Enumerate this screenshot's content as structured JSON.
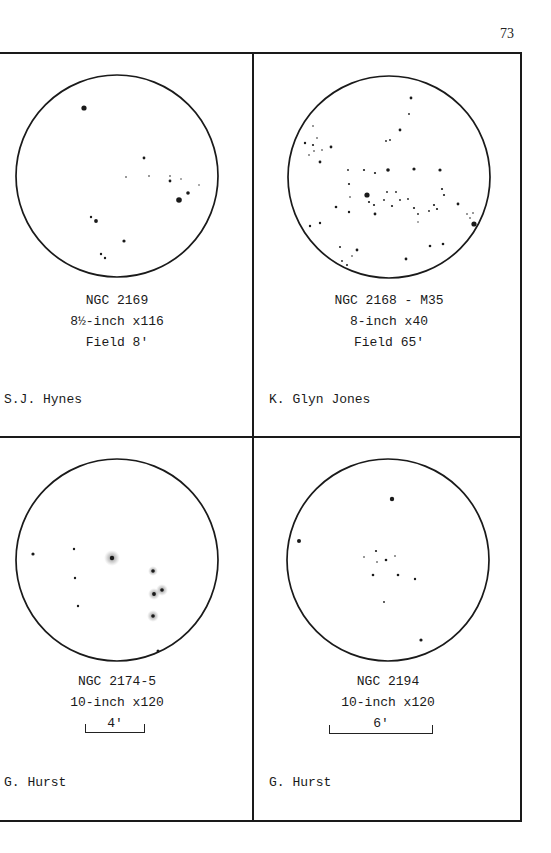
{
  "page": {
    "number": "73"
  },
  "panels": [
    {
      "object": "NGC 2169",
      "telescope": "8½-inch x116",
      "field": "Field 8'",
      "observer": "S.J. Hynes",
      "circle": {
        "cx": 117,
        "cy": 176,
        "r": 101
      },
      "stars": [
        {
          "x": 84,
          "y": 108,
          "s": 2.6
        },
        {
          "x": 144,
          "y": 158,
          "s": 1.4
        },
        {
          "x": 126,
          "y": 177,
          "s": 0.8
        },
        {
          "x": 149,
          "y": 176,
          "s": 0.8
        },
        {
          "x": 170,
          "y": 176,
          "s": 0.8
        },
        {
          "x": 170,
          "y": 181,
          "s": 1.4
        },
        {
          "x": 181,
          "y": 179,
          "s": 0.7
        },
        {
          "x": 199,
          "y": 185,
          "s": 0.7
        },
        {
          "x": 188,
          "y": 193,
          "s": 1.8
        },
        {
          "x": 179,
          "y": 200,
          "s": 2.8
        },
        {
          "x": 91,
          "y": 217,
          "s": 1.2
        },
        {
          "x": 96,
          "y": 221,
          "s": 1.9
        },
        {
          "x": 124,
          "y": 241,
          "s": 1.6
        },
        {
          "x": 101,
          "y": 254,
          "s": 1.2
        },
        {
          "x": 105,
          "y": 258,
          "s": 1.2
        }
      ]
    },
    {
      "object": "NGC 2168 - M35",
      "telescope": "8-inch x40",
      "field": "Field 65'",
      "observer": "K. Glyn Jones",
      "circle": {
        "cx": 389,
        "cy": 177,
        "r": 101
      },
      "stars": [
        {
          "x": 411,
          "y": 98,
          "s": 1.4
        },
        {
          "x": 409,
          "y": 114,
          "s": 0.9
        },
        {
          "x": 400,
          "y": 130,
          "s": 1.4
        },
        {
          "x": 386,
          "y": 141,
          "s": 0.9
        },
        {
          "x": 390,
          "y": 140,
          "s": 0.9
        },
        {
          "x": 313,
          "y": 126,
          "s": 0.8
        },
        {
          "x": 305,
          "y": 143,
          "s": 1.2
        },
        {
          "x": 317,
          "y": 138,
          "s": 0.8
        },
        {
          "x": 313,
          "y": 145,
          "s": 1.1
        },
        {
          "x": 314,
          "y": 151,
          "s": 0.8
        },
        {
          "x": 322,
          "y": 150,
          "s": 0.8
        },
        {
          "x": 331,
          "y": 147,
          "s": 1.4
        },
        {
          "x": 309,
          "y": 155,
          "s": 0.8
        },
        {
          "x": 320,
          "y": 162,
          "s": 1.4
        },
        {
          "x": 348,
          "y": 170,
          "s": 0.9
        },
        {
          "x": 364,
          "y": 170,
          "s": 1.1
        },
        {
          "x": 375,
          "y": 173,
          "s": 1.1
        },
        {
          "x": 388,
          "y": 170,
          "s": 1.8
        },
        {
          "x": 414,
          "y": 169,
          "s": 1.6
        },
        {
          "x": 440,
          "y": 170,
          "s": 1.6
        },
        {
          "x": 349,
          "y": 184,
          "s": 1.1
        },
        {
          "x": 367,
          "y": 195,
          "s": 2.6
        },
        {
          "x": 350,
          "y": 197,
          "s": 0.8
        },
        {
          "x": 369,
          "y": 202,
          "s": 1.1
        },
        {
          "x": 374,
          "y": 205,
          "s": 1.1
        },
        {
          "x": 387,
          "y": 192,
          "s": 0.9
        },
        {
          "x": 396,
          "y": 192,
          "s": 0.9
        },
        {
          "x": 384,
          "y": 200,
          "s": 0.9
        },
        {
          "x": 400,
          "y": 200,
          "s": 0.9
        },
        {
          "x": 408,
          "y": 199,
          "s": 0.9
        },
        {
          "x": 392,
          "y": 206,
          "s": 1.1
        },
        {
          "x": 442,
          "y": 189,
          "s": 1.1
        },
        {
          "x": 444,
          "y": 195,
          "s": 1.1
        },
        {
          "x": 336,
          "y": 207,
          "s": 1.3
        },
        {
          "x": 349,
          "y": 212,
          "s": 1.2
        },
        {
          "x": 375,
          "y": 214,
          "s": 1.4
        },
        {
          "x": 414,
          "y": 208,
          "s": 1.1
        },
        {
          "x": 418,
          "y": 214,
          "s": 0.9
        },
        {
          "x": 418,
          "y": 222,
          "s": 0.7
        },
        {
          "x": 429,
          "y": 211,
          "s": 0.9
        },
        {
          "x": 434,
          "y": 205,
          "s": 1.1
        },
        {
          "x": 437,
          "y": 209,
          "s": 1.1
        },
        {
          "x": 458,
          "y": 204,
          "s": 1.4
        },
        {
          "x": 467,
          "y": 214,
          "s": 0.8
        },
        {
          "x": 473,
          "y": 213,
          "s": 0.8
        },
        {
          "x": 470,
          "y": 218,
          "s": 0.8
        },
        {
          "x": 474,
          "y": 224,
          "s": 2.6
        },
        {
          "x": 310,
          "y": 226,
          "s": 1.2
        },
        {
          "x": 320,
          "y": 223,
          "s": 1.2
        },
        {
          "x": 340,
          "y": 247,
          "s": 1.0
        },
        {
          "x": 357,
          "y": 250,
          "s": 1.4
        },
        {
          "x": 352,
          "y": 256,
          "s": 0.8
        },
        {
          "x": 342,
          "y": 261,
          "s": 0.9
        },
        {
          "x": 347,
          "y": 265,
          "s": 1.0
        },
        {
          "x": 406,
          "y": 259,
          "s": 1.4
        },
        {
          "x": 430,
          "y": 246,
          "s": 1.3
        },
        {
          "x": 443,
          "y": 244,
          "s": 1.3
        }
      ]
    },
    {
      "object": "NGC 2174-5",
      "telescope": "10-inch x120",
      "scale": "4'",
      "observer": "G. Hurst",
      "circle": {
        "cx": 117,
        "cy": 560,
        "r": 101
      },
      "stars": [
        {
          "x": 33,
          "y": 554,
          "s": 1.6
        },
        {
          "x": 74,
          "y": 549,
          "s": 1.2
        },
        {
          "x": 75,
          "y": 578,
          "s": 1.2
        },
        {
          "x": 78,
          "y": 606,
          "s": 1.2
        },
        {
          "x": 158,
          "y": 651,
          "s": 1.5
        }
      ],
      "nebulous_stars": [
        {
          "x": 112,
          "y": 558,
          "s": 2.2,
          "halo": 8
        },
        {
          "x": 153,
          "y": 571,
          "s": 1.8,
          "halo": 5
        },
        {
          "x": 154,
          "y": 594,
          "s": 1.9,
          "halo": 6
        },
        {
          "x": 162,
          "y": 590,
          "s": 1.8,
          "halo": 6
        },
        {
          "x": 153,
          "y": 616,
          "s": 1.8,
          "halo": 6
        }
      ]
    },
    {
      "object": "NGC 2194",
      "telescope": "10-inch x120",
      "scale": "6'",
      "observer": "G. Hurst",
      "circle": {
        "cx": 388,
        "cy": 560,
        "r": 101
      },
      "stars": [
        {
          "x": 392,
          "y": 499,
          "s": 2.2
        },
        {
          "x": 299,
          "y": 541,
          "s": 2.0
        },
        {
          "x": 376,
          "y": 551,
          "s": 1.1
        },
        {
          "x": 364,
          "y": 557,
          "s": 0.8
        },
        {
          "x": 395,
          "y": 556,
          "s": 0.8
        },
        {
          "x": 386,
          "y": 560,
          "s": 1.3
        },
        {
          "x": 377,
          "y": 562,
          "s": 0.8
        },
        {
          "x": 373,
          "y": 575,
          "s": 1.3
        },
        {
          "x": 398,
          "y": 575,
          "s": 1.3
        },
        {
          "x": 415,
          "y": 579,
          "s": 1.2
        },
        {
          "x": 384,
          "y": 602,
          "s": 0.9
        },
        {
          "x": 421,
          "y": 640,
          "s": 1.6
        }
      ]
    }
  ],
  "colors": {
    "ink": "#1a1a1a",
    "paper": "#ffffff"
  }
}
